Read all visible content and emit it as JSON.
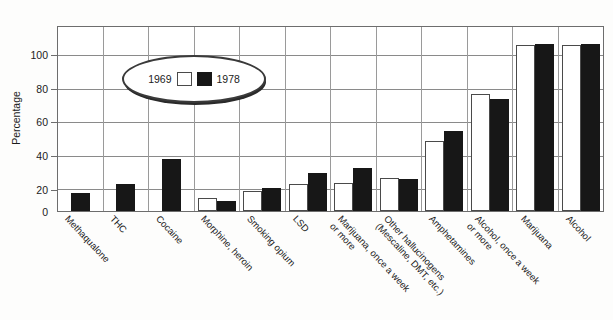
{
  "chart_data": {
    "type": "bar",
    "title": "",
    "xlabel": "",
    "ylabel": "Percentage",
    "ylim": [
      0,
      110
    ],
    "yticks": [
      0,
      20,
      40,
      60,
      80,
      100
    ],
    "grid": true,
    "legend_position": "top-left",
    "categories": [
      "Methaqualone",
      "THC",
      "Cocaine",
      "Morphine, heroin",
      "Smoking opium",
      "LSD",
      "Marijuana, once a week\nor more",
      "Other hallucinogens\n(Mescaline, DMT, etc.)",
      "Amphetamines",
      "Alcohol, once a week\nor more",
      "Marijuana",
      "Alcohol"
    ],
    "series": [
      {
        "name": "1969",
        "color": "#ffffff",
        "values": [
          0,
          0,
          0,
          8,
          12,
          16,
          17,
          20,
          42,
          70,
          99,
          99
        ]
      },
      {
        "name": "1978",
        "color": "#171717",
        "values": [
          11,
          16,
          31,
          6,
          14,
          23,
          26,
          19,
          48,
          67,
          100,
          100
        ]
      }
    ]
  },
  "legend": {
    "left_label": "1969",
    "right_label": "1978",
    "left_swatch": "white-square-icon",
    "right_swatch": "black-square-icon"
  },
  "axis": {
    "y_title": "Percentage",
    "y_tick_labels": [
      "0",
      "20",
      "40",
      "60",
      "80",
      "100"
    ]
  }
}
